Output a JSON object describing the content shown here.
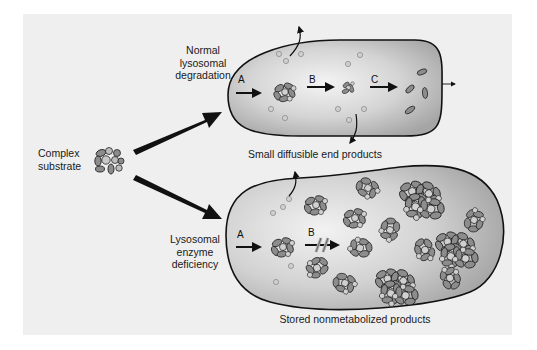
{
  "diagram": {
    "source_node": {
      "label_lines": [
        "Complex",
        "substrate"
      ]
    },
    "normal_pathway": {
      "label_lines": [
        "Normal",
        "lysosomal",
        "degradation"
      ],
      "steps": [
        "A",
        "B",
        "C"
      ],
      "caption": "Small diffusible end products"
    },
    "deficient_pathway": {
      "label_lines": [
        "Lysosomal",
        "enzyme",
        "deficiency"
      ],
      "steps": [
        "A",
        "B"
      ],
      "blocked_step": "B",
      "caption": "Stored nonmetabolized products"
    },
    "colors": {
      "panel_background": "#efefef",
      "organelle_fill_light": "#e8e8e8",
      "organelle_fill_dark": "#a9a9a9",
      "organelle_outline": "#111111",
      "particle_dark": "#8a8a8a",
      "particle_light": "#cfcfcf",
      "arrow": "#111111",
      "text": "#1a1a1a"
    }
  }
}
